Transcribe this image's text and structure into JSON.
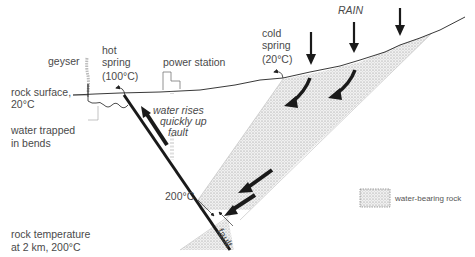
{
  "diagram": {
    "title_label": "RAIN",
    "labels": {
      "geyser": "geyser",
      "hot_spring_line1": "hot",
      "hot_spring_line2": "spring",
      "hot_spring_temp": "(100°C)",
      "power_station": "power station",
      "cold_spring_line1": "cold",
      "cold_spring_line2": "spring",
      "cold_spring_temp": "(20°C)",
      "rock_surface_line1": "rock surface,",
      "rock_surface_line2": "20°C",
      "water_trapped_line1": "water trapped",
      "water_trapped_line2": "in bends",
      "water_rises_line1": "water rises",
      "water_rises_line2": "quickly up",
      "water_rises_line3": "fault",
      "fault_temp": "200°C",
      "fault_label": "fault",
      "rock_temp_line1": "rock temperature",
      "rock_temp_line2": "at 2 km, 200°C"
    },
    "legend": {
      "items": [
        {
          "swatch": "stippled",
          "label": "water-bearing rock"
        }
      ]
    },
    "colors": {
      "line": "#1a1a1a",
      "stipple_bg": "#ececec",
      "stipple_dot": "#8a8a8a",
      "text": "#4a4a4a"
    }
  }
}
